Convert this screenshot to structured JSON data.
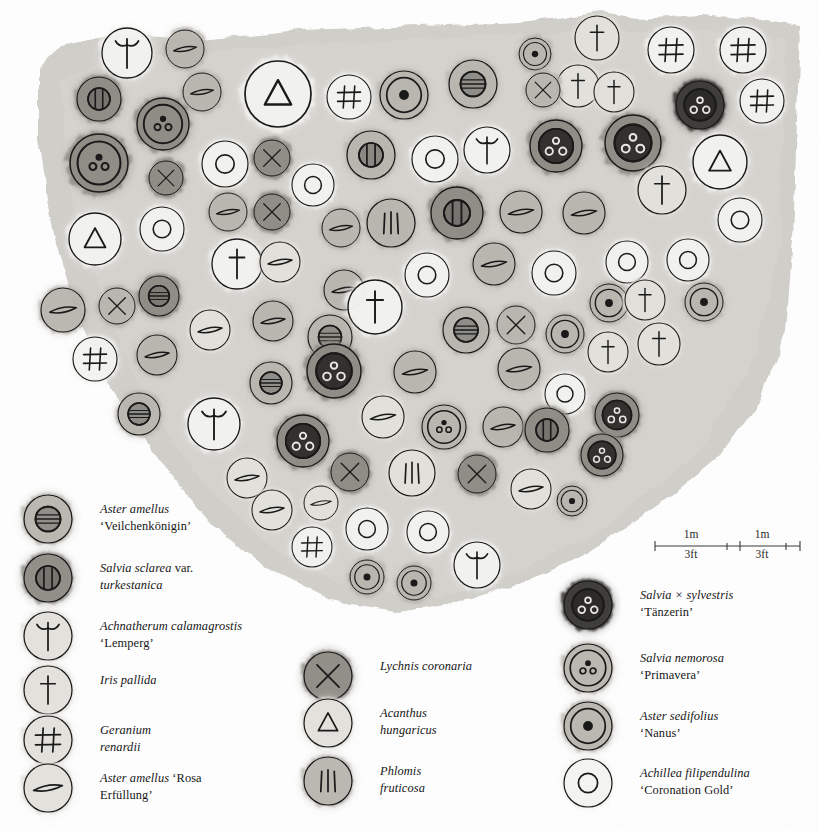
{
  "scale_bar": {
    "segments": [
      {
        "metric": "1m",
        "imperial": "3ft"
      },
      {
        "metric": "1m",
        "imperial": "3ft"
      }
    ]
  },
  "legend": {
    "columns": [
      {
        "name": "left-legend-column",
        "x": 20,
        "entries": [
          {
            "symbol": "ring-bar",
            "sym_y": 519,
            "tone": "mid",
            "lines": [
              {
                "t": "Aster amellus",
                "style": "it"
              },
              {
                "t": "‘Veilchenkönigin’",
                "style": "ro"
              }
            ]
          },
          {
            "symbol": "ring-double-bar",
            "sym_y": 578,
            "tone": "dark",
            "lines": [
              {
                "t": "Salvia sclarea ",
                "style": "it"
              },
              {
                "t": "var.",
                "style": "ro",
                "sameline": true
              },
              {
                "t": "turkestanica",
                "style": "it"
              }
            ]
          },
          {
            "symbol": "grass-tuft",
            "sym_y": 636,
            "tone": "light",
            "lines": [
              {
                "t": "Achnatherum calamagrostis",
                "style": "it"
              },
              {
                "t": "‘Lemperg’",
                "style": "ro"
              }
            ]
          },
          {
            "symbol": "dagger",
            "sym_y": 690,
            "tone": "light",
            "lines": [
              {
                "t": "Iris pallida",
                "style": "it"
              }
            ]
          },
          {
            "symbol": "hash",
            "sym_y": 740,
            "tone": "light",
            "lines": [
              {
                "t": "Geranium",
                "style": "it"
              },
              {
                "t": "renardii",
                "style": "it"
              }
            ]
          },
          {
            "symbol": "lens-bar",
            "sym_y": 788,
            "tone": "light",
            "lines": [
              {
                "t": "Aster amellus ",
                "style": "it"
              },
              {
                "t": "‘Rosa",
                "style": "ro",
                "sameline": true
              },
              {
                "t": "Erfüllung’",
                "style": "ro"
              }
            ]
          }
        ]
      },
      {
        "name": "middle-legend-column",
        "x": 300,
        "entries": [
          {
            "symbol": "cross-x",
            "sym_y": 676,
            "tone": "dark",
            "lines": [
              {
                "t": "Lychnis coronaria",
                "style": "it"
              }
            ]
          },
          {
            "symbol": "triangle",
            "sym_y": 723,
            "tone": "light",
            "lines": [
              {
                "t": "Acanthus",
                "style": "it"
              },
              {
                "t": "hungaricus",
                "style": "it"
              }
            ]
          },
          {
            "symbol": "tri-bars",
            "sym_y": 781,
            "tone": "mid",
            "lines": [
              {
                "t": "Phlomis",
                "style": "it"
              },
              {
                "t": "fruticosa",
                "style": "it"
              }
            ]
          }
        ]
      },
      {
        "name": "right-legend-column",
        "x": 560,
        "entries": [
          {
            "symbol": "triple-ring-dot",
            "sym_y": 605,
            "tone": "vdark",
            "lines": [
              {
                "t": "Salvia × sylvestris",
                "style": "it"
              },
              {
                "t": "‘Tänzerin’",
                "style": "ro"
              }
            ]
          },
          {
            "symbol": "triple-ring",
            "sym_y": 668,
            "tone": "mid",
            "lines": [
              {
                "t": "Salvia nemorosa",
                "style": "it"
              },
              {
                "t": "‘Primavera’",
                "style": "ro"
              }
            ]
          },
          {
            "symbol": "center-dot",
            "sym_y": 726,
            "tone": "mid",
            "lines": [
              {
                "t": "Aster sedifolius",
                "style": "it"
              },
              {
                "t": "‘Nanus’",
                "style": "ro"
              }
            ]
          },
          {
            "symbol": "ring-open",
            "sym_y": 783,
            "tone": "vlight",
            "lines": [
              {
                "t": "Achillea filipendulina",
                "style": "it"
              },
              {
                "t": "‘Coronation Gold’",
                "style": "ro"
              }
            ]
          }
        ]
      }
    ]
  },
  "colors": {
    "paper": "#ffffff",
    "bed_wash": "#cfcdc8",
    "ink": "#1a1a1a",
    "tone_vlight": "#f3f2ef",
    "tone_light": "#e2e0db",
    "tone_mid": "#b8b5ae",
    "tone_dark": "#8d8a84",
    "tone_vdark": "#3f3d3a"
  },
  "plan": {
    "name": "planting-plan",
    "plants": [
      {
        "s": "grass-tuft",
        "x": 127,
        "y": 53,
        "r": 25,
        "tone": "vlight"
      },
      {
        "s": "lens-bar",
        "x": 185,
        "y": 49,
        "r": 19,
        "tone": "mid"
      },
      {
        "s": "lens-bar",
        "x": 202,
        "y": 92,
        "r": 19,
        "tone": "mid"
      },
      {
        "s": "ring-double-bar",
        "x": 99,
        "y": 99,
        "r": 22,
        "tone": "dark"
      },
      {
        "s": "triple-ring",
        "x": 163,
        "y": 124,
        "r": 26,
        "tone": "dark"
      },
      {
        "s": "triple-ring",
        "x": 99,
        "y": 163,
        "r": 29,
        "tone": "dark"
      },
      {
        "s": "cross-x",
        "x": 166,
        "y": 178,
        "r": 17,
        "tone": "dark"
      },
      {
        "s": "triangle",
        "x": 278,
        "y": 94,
        "r": 33,
        "tone": "vlight"
      },
      {
        "s": "hash",
        "x": 349,
        "y": 97,
        "r": 22,
        "tone": "vlight"
      },
      {
        "s": "center-dot",
        "x": 404,
        "y": 95,
        "r": 24,
        "tone": "mid"
      },
      {
        "s": "ring-bar",
        "x": 473,
        "y": 84,
        "r": 24,
        "tone": "mid"
      },
      {
        "s": "center-dot",
        "x": 535,
        "y": 54,
        "r": 16,
        "tone": "mid"
      },
      {
        "s": "dagger",
        "x": 597,
        "y": 38,
        "r": 22,
        "tone": "light"
      },
      {
        "s": "dagger",
        "x": 578,
        "y": 86,
        "r": 21,
        "tone": "light"
      },
      {
        "s": "dagger",
        "x": 614,
        "y": 92,
        "r": 20,
        "tone": "light"
      },
      {
        "s": "hash",
        "x": 671,
        "y": 50,
        "r": 23,
        "tone": "vlight"
      },
      {
        "s": "hash",
        "x": 743,
        "y": 50,
        "r": 23,
        "tone": "vlight"
      },
      {
        "s": "triple-ring-dot",
        "x": 700,
        "y": 105,
        "r": 24,
        "tone": "vdark"
      },
      {
        "s": "hash",
        "x": 762,
        "y": 101,
        "r": 22,
        "tone": "vlight"
      },
      {
        "s": "ring-open",
        "x": 225,
        "y": 164,
        "r": 23,
        "tone": "vlight"
      },
      {
        "s": "cross-x",
        "x": 272,
        "y": 158,
        "r": 18,
        "tone": "dark"
      },
      {
        "s": "ring-double-bar",
        "x": 371,
        "y": 155,
        "r": 24,
        "tone": "mid"
      },
      {
        "s": "ring-open",
        "x": 435,
        "y": 159,
        "r": 23,
        "tone": "vlight"
      },
      {
        "s": "grass-tuft",
        "x": 487,
        "y": 150,
        "r": 23,
        "tone": "vlight"
      },
      {
        "s": "triple-ring-dot",
        "x": 556,
        "y": 146,
        "r": 26,
        "tone": "dark"
      },
      {
        "s": "triple-ring-dot",
        "x": 633,
        "y": 143,
        "r": 28,
        "tone": "dark"
      },
      {
        "s": "cross-x",
        "x": 543,
        "y": 90,
        "r": 17,
        "tone": "mid"
      },
      {
        "s": "triangle",
        "x": 720,
        "y": 162,
        "r": 27,
        "tone": "vlight"
      },
      {
        "s": "dagger",
        "x": 662,
        "y": 190,
        "r": 24,
        "tone": "light"
      },
      {
        "s": "lens-bar",
        "x": 228,
        "y": 212,
        "r": 19,
        "tone": "mid"
      },
      {
        "s": "cross-x",
        "x": 272,
        "y": 212,
        "r": 18,
        "tone": "dark"
      },
      {
        "s": "ring-open",
        "x": 313,
        "y": 185,
        "r": 21,
        "tone": "vlight"
      },
      {
        "s": "lens-bar",
        "x": 341,
        "y": 228,
        "r": 19,
        "tone": "mid"
      },
      {
        "s": "tri-bars",
        "x": 391,
        "y": 223,
        "r": 24,
        "tone": "mid"
      },
      {
        "s": "ring-double-bar",
        "x": 457,
        "y": 213,
        "r": 26,
        "tone": "dark"
      },
      {
        "s": "lens-bar",
        "x": 521,
        "y": 212,
        "r": 21,
        "tone": "mid"
      },
      {
        "s": "lens-bar",
        "x": 584,
        "y": 213,
        "r": 21,
        "tone": "mid"
      },
      {
        "s": "ring-open",
        "x": 740,
        "y": 220,
        "r": 22,
        "tone": "vlight"
      },
      {
        "s": "triangle",
        "x": 95,
        "y": 239,
        "r": 26,
        "tone": "vlight"
      },
      {
        "s": "ring-open",
        "x": 162,
        "y": 229,
        "r": 22,
        "tone": "vlight"
      },
      {
        "s": "dagger",
        "x": 237,
        "y": 264,
        "r": 25,
        "tone": "vlight"
      },
      {
        "s": "lens-bar",
        "x": 280,
        "y": 262,
        "r": 20,
        "tone": "light"
      },
      {
        "s": "lens-bar",
        "x": 344,
        "y": 290,
        "r": 20,
        "tone": "mid"
      },
      {
        "s": "ring-open",
        "x": 427,
        "y": 275,
        "r": 22,
        "tone": "vlight"
      },
      {
        "s": "lens-bar",
        "x": 494,
        "y": 264,
        "r": 21,
        "tone": "mid"
      },
      {
        "s": "ring-open",
        "x": 554,
        "y": 273,
        "r": 22,
        "tone": "vlight"
      },
      {
        "s": "ring-open",
        "x": 627,
        "y": 262,
        "r": 21,
        "tone": "vlight"
      },
      {
        "s": "ring-open",
        "x": 688,
        "y": 260,
        "r": 21,
        "tone": "vlight"
      },
      {
        "s": "dagger",
        "x": 375,
        "y": 307,
        "r": 27,
        "tone": "vlight"
      },
      {
        "s": "lens-bar",
        "x": 63,
        "y": 310,
        "r": 22,
        "tone": "mid"
      },
      {
        "s": "cross-x",
        "x": 117,
        "y": 306,
        "r": 18,
        "tone": "mid"
      },
      {
        "s": "ring-bar",
        "x": 159,
        "y": 296,
        "r": 20,
        "tone": "dark"
      },
      {
        "s": "lens-bar",
        "x": 210,
        "y": 330,
        "r": 20,
        "tone": "light"
      },
      {
        "s": "lens-bar",
        "x": 273,
        "y": 321,
        "r": 20,
        "tone": "mid"
      },
      {
        "s": "ring-bar",
        "x": 330,
        "y": 337,
        "r": 22,
        "tone": "mid"
      },
      {
        "s": "center-dot",
        "x": 609,
        "y": 303,
        "r": 19,
        "tone": "mid"
      },
      {
        "s": "dagger",
        "x": 645,
        "y": 300,
        "r": 20,
        "tone": "light"
      },
      {
        "s": "center-dot",
        "x": 704,
        "y": 302,
        "r": 19,
        "tone": "mid"
      },
      {
        "s": "ring-bar",
        "x": 466,
        "y": 330,
        "r": 23,
        "tone": "mid"
      },
      {
        "s": "cross-x",
        "x": 516,
        "y": 325,
        "r": 19,
        "tone": "mid"
      },
      {
        "s": "center-dot",
        "x": 565,
        "y": 334,
        "r": 19,
        "tone": "mid"
      },
      {
        "s": "dagger",
        "x": 608,
        "y": 352,
        "r": 20,
        "tone": "light"
      },
      {
        "s": "dagger",
        "x": 659,
        "y": 344,
        "r": 21,
        "tone": "light"
      },
      {
        "s": "hash",
        "x": 95,
        "y": 359,
        "r": 22,
        "tone": "vlight"
      },
      {
        "s": "lens-bar",
        "x": 157,
        "y": 355,
        "r": 20,
        "tone": "mid"
      },
      {
        "s": "ring-bar",
        "x": 271,
        "y": 383,
        "r": 21,
        "tone": "mid"
      },
      {
        "s": "triple-ring-dot",
        "x": 334,
        "y": 371,
        "r": 27,
        "tone": "dark"
      },
      {
        "s": "lens-bar",
        "x": 415,
        "y": 372,
        "r": 21,
        "tone": "mid"
      },
      {
        "s": "lens-bar",
        "x": 519,
        "y": 369,
        "r": 21,
        "tone": "mid"
      },
      {
        "s": "ring-open",
        "x": 565,
        "y": 394,
        "r": 20,
        "tone": "vlight"
      },
      {
        "s": "ring-bar",
        "x": 139,
        "y": 414,
        "r": 21,
        "tone": "mid"
      },
      {
        "s": "grass-tuft",
        "x": 214,
        "y": 424,
        "r": 26,
        "tone": "vlight"
      },
      {
        "s": "lens-bar",
        "x": 383,
        "y": 417,
        "r": 21,
        "tone": "light"
      },
      {
        "s": "triple-ring",
        "x": 444,
        "y": 427,
        "r": 22,
        "tone": "mid"
      },
      {
        "s": "lens-bar",
        "x": 503,
        "y": 427,
        "r": 20,
        "tone": "mid"
      },
      {
        "s": "ring-double-bar",
        "x": 547,
        "y": 430,
        "r": 22,
        "tone": "dark"
      },
      {
        "s": "triple-ring-dot",
        "x": 617,
        "y": 415,
        "r": 22,
        "tone": "dark"
      },
      {
        "s": "triple-ring-dot",
        "x": 303,
        "y": 441,
        "r": 26,
        "tone": "dark"
      },
      {
        "s": "triple-ring-dot",
        "x": 602,
        "y": 455,
        "r": 21,
        "tone": "dark"
      },
      {
        "s": "lens-bar",
        "x": 247,
        "y": 478,
        "r": 20,
        "tone": "light"
      },
      {
        "s": "cross-x",
        "x": 350,
        "y": 472,
        "r": 19,
        "tone": "dark"
      },
      {
        "s": "tri-bars",
        "x": 412,
        "y": 473,
        "r": 23,
        "tone": "light"
      },
      {
        "s": "cross-x",
        "x": 477,
        "y": 474,
        "r": 19,
        "tone": "dark"
      },
      {
        "s": "lens-bar",
        "x": 531,
        "y": 489,
        "r": 20,
        "tone": "light"
      },
      {
        "s": "center-dot",
        "x": 572,
        "y": 501,
        "r": 15,
        "tone": "mid"
      },
      {
        "s": "lens-bar",
        "x": 272,
        "y": 510,
        "r": 20,
        "tone": "light"
      },
      {
        "s": "lens-bar",
        "x": 321,
        "y": 503,
        "r": 17,
        "tone": "light"
      },
      {
        "s": "hash",
        "x": 312,
        "y": 547,
        "r": 20,
        "tone": "vlight"
      },
      {
        "s": "ring-open",
        "x": 367,
        "y": 529,
        "r": 21,
        "tone": "vlight"
      },
      {
        "s": "ring-open",
        "x": 428,
        "y": 532,
        "r": 21,
        "tone": "vlight"
      },
      {
        "s": "center-dot",
        "x": 367,
        "y": 577,
        "r": 17,
        "tone": "mid"
      },
      {
        "s": "center-dot",
        "x": 414,
        "y": 583,
        "r": 17,
        "tone": "mid"
      },
      {
        "s": "grass-tuft",
        "x": 477,
        "y": 565,
        "r": 23,
        "tone": "vlight"
      }
    ]
  }
}
